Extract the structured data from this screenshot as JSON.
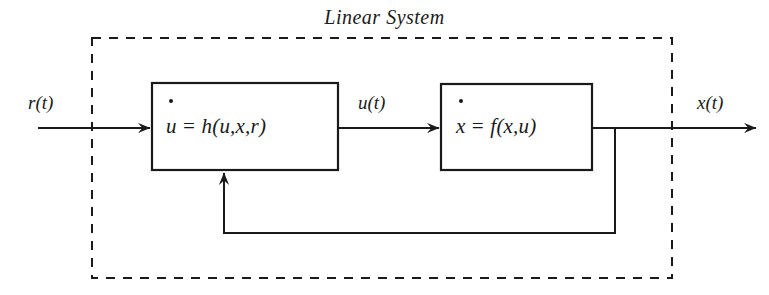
{
  "diagram": {
    "title": "Linear System",
    "boundary": {
      "style": "dashed",
      "color": "#1a1a1a"
    },
    "stroke_color": "#1a1a1a",
    "background_color": "#ffffff",
    "blocks": [
      {
        "id": "block-1",
        "equation": "u̇ = h(u,x,r)",
        "lhs_var": "u",
        "lhs_dot": true,
        "rhs": "= h(u,x,r)"
      },
      {
        "id": "block-2",
        "equation": "ẋ = f(x,u)",
        "lhs_var": "x",
        "lhs_dot": true,
        "rhs": "= f(x,u)"
      }
    ],
    "signals": {
      "input": "r(t)",
      "intermediate": "u(t)",
      "output": "x(t)"
    }
  }
}
